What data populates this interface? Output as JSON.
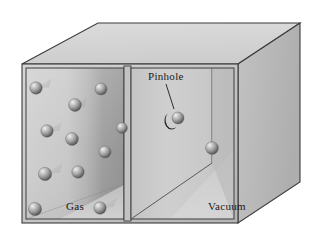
{
  "figure": {
    "type": "3d-box-diagram"
  },
  "labels": {
    "gas": "Gas",
    "vacuum": "Vacuum",
    "pinhole": "Pinhole"
  },
  "colors": {
    "background": "#ffffff",
    "outline": "#3b3b3b",
    "top_face": "#d4d4d4",
    "right_face": "#b8b8b8",
    "front_frame": "#c9c9c9",
    "gas_wall_light": "#cfcfcf",
    "gas_wall_dark": "#9a9a9a",
    "gas_floor": "#c4c4c4",
    "vacuum_wall": "#c9c9c9",
    "vacuum_floor": "#bdbdbd",
    "sphere_light": "#e6e6e6",
    "sphere_mid": "#9b9b9b",
    "sphere_dark": "#4a4a4a",
    "pinhole": "#2a2a2a",
    "label_text": "#1a1a1a"
  },
  "geometry": {
    "box_front_top_left": [
      22,
      64
    ],
    "box_front_top_right": [
      238,
      64
    ],
    "box_front_bottom_left": [
      22,
      223
    ],
    "box_front_bottom_right": [
      238,
      223
    ],
    "box_back_top_left": [
      98,
      23
    ],
    "box_back_top_right": [
      300,
      23
    ],
    "box_back_bottom_right": [
      300,
      182
    ],
    "divider_x": 128,
    "pinhole_center": [
      175,
      117
    ],
    "pinhole_radius": 7
  },
  "chambers": [
    {
      "name": "gas-chamber",
      "label": "Gas",
      "x_range": [
        22,
        128
      ],
      "particle_count": 11
    },
    {
      "name": "vacuum-chamber",
      "label": "Vacuum",
      "x_range": [
        132,
        238
      ],
      "particle_count": 1
    }
  ],
  "gas_particles": [
    {
      "cx": 36,
      "cy": 88,
      "r": 6.2,
      "trail": 16
    },
    {
      "cx": 101,
      "cy": 89,
      "r": 6.0,
      "trail": 0
    },
    {
      "cx": 75,
      "cy": 105,
      "r": 6.4,
      "trail": 12
    },
    {
      "cx": 47,
      "cy": 131,
      "r": 6.2,
      "trail": 15
    },
    {
      "cx": 72,
      "cy": 139,
      "r": 6.4,
      "trail": 0
    },
    {
      "cx": 105,
      "cy": 152,
      "r": 6.0,
      "trail": 11
    },
    {
      "cx": 45,
      "cy": 174,
      "r": 6.6,
      "trail": 18
    },
    {
      "cx": 78,
      "cy": 172,
      "r": 6.2,
      "trail": 0
    },
    {
      "cx": 35,
      "cy": 209,
      "r": 6.6,
      "trail": 0
    },
    {
      "cx": 100,
      "cy": 208,
      "r": 6.2,
      "trail": 17
    },
    {
      "cx": 122,
      "cy": 128,
      "r": 5.4,
      "trail": 0
    }
  ],
  "vacuum_particles": [
    {
      "cx": 212,
      "cy": 148,
      "r": 6.4
    }
  ],
  "escaping_particle": {
    "cx": 178,
    "cy": 118,
    "r": 6.0
  },
  "leader_line": {
    "from": [
      166,
      84
    ],
    "to": [
      174,
      109
    ]
  }
}
